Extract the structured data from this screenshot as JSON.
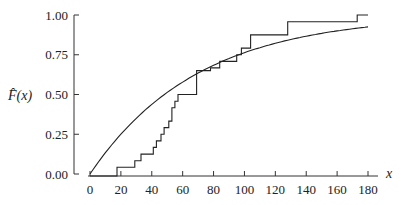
{
  "chart_data": {
    "type": "line",
    "title": "",
    "xlabel": "x",
    "ylabel": "F̂(x)",
    "xlim": [
      0,
      180
    ],
    "ylim": [
      0,
      1
    ],
    "x_ticks": [
      "0",
      "20",
      "40",
      "60",
      "80",
      "100",
      "120",
      "140",
      "160",
      "180"
    ],
    "y_ticks": [
      "0.00",
      "0.25",
      "0.50",
      "0.75",
      "1.00"
    ],
    "grid": false,
    "legend": null,
    "series": [
      {
        "name": "empirical CDF (step)",
        "kind": "step",
        "x": [
          0,
          17.5,
          29,
          33,
          41,
          43,
          46,
          48,
          51,
          53,
          55,
          57,
          69,
          78,
          84,
          95,
          98,
          104,
          128,
          173,
          180
        ],
        "y": [
          0.0,
          0.042,
          0.083,
          0.125,
          0.167,
          0.208,
          0.25,
          0.292,
          0.333,
          0.417,
          0.458,
          0.5,
          0.65,
          0.667,
          0.708,
          0.75,
          0.792,
          0.875,
          0.958,
          1.0,
          1.0
        ]
      },
      {
        "name": "fitted exponential CDF",
        "kind": "smooth",
        "formula": "1 - exp(-x/69.5)",
        "x": [
          0,
          20,
          40,
          60,
          80,
          100,
          120,
          140,
          160,
          180
        ],
        "y": [
          0.0,
          0.25,
          0.438,
          0.578,
          0.684,
          0.763,
          0.822,
          0.867,
          0.9,
          0.925
        ]
      }
    ]
  }
}
